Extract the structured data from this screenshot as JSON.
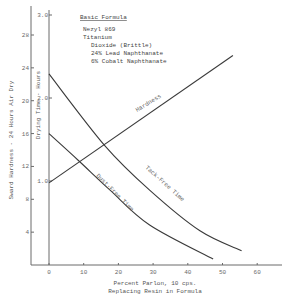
{
  "chart_data": {
    "type": "line",
    "title": "",
    "xlabel": "Percent Parlon, 10 cps.",
    "xlabel_line2": "Replacing Resin in Formula",
    "ylabel_left": "Sward Hardness - 24 Hours Air Dry",
    "ylabel_inner": "Drying Time - Hours",
    "xlim": [
      -5,
      67
    ],
    "x_ticks": [
      0,
      10,
      20,
      30,
      40,
      50,
      60
    ],
    "ylim_left": [
      0,
      28
    ],
    "y_left_ticks": [
      4,
      8,
      12,
      16,
      20,
      24,
      28
    ],
    "ylim_inner": [
      0,
      3.0
    ],
    "y_inner_ticks": [
      "1.0",
      "2.0",
      "3.0"
    ],
    "grid": false,
    "legend_box": {
      "title": "Basic Formula",
      "lines": [
        "Nezyl 869",
        "Titanium",
        "Dioxide (Brittle)",
        "24% Lead Naphthanate",
        "6% Cobalt Naphthanate"
      ]
    },
    "series": [
      {
        "name": "Hardness",
        "axis": "sward_hardness",
        "x": [
          0,
          53
        ],
        "y": [
          10,
          25.5
        ]
      },
      {
        "name": "Tack-Free Time",
        "axis": "drying_time_hours",
        "x": [
          0,
          16,
          29,
          43.5,
          55.5
        ],
        "y": [
          2.29,
          1.43,
          0.89,
          0.4,
          0.16
        ]
      },
      {
        "name": "Dust-Free Time",
        "axis": "drying_time_hours",
        "x": [
          0,
          8.4,
          17.6,
          29,
          47.3
        ],
        "y": [
          1.57,
          1.25,
          0.89,
          0.47,
          0.06
        ]
      }
    ]
  },
  "labels": {
    "legend_title": "Basic Formula",
    "legend_lines": [
      "Nezyl 869",
      "Titanium",
      "Dioxide (Brittle)",
      "24% Lead Naphthanate",
      "6% Cobalt Naphthanate"
    ],
    "xlabel1": "Percent Parlon, 10 cps.",
    "xlabel2": "Replacing Resin in Formula",
    "ylabel_left": "Sward Hardness - 24 Hours Air Dry",
    "ylabel_inner": "Drying Time - Hours",
    "hardness": "Hardness",
    "tack": "Tack-Free Time",
    "dust": "Dust-Free Time"
  }
}
